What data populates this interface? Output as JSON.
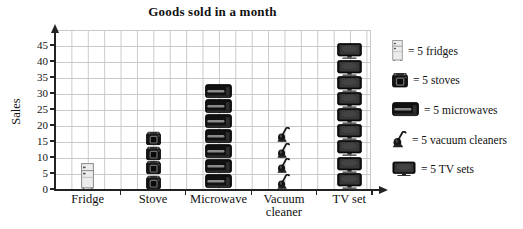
{
  "title": "Goods sold in a month",
  "y_axis": {
    "label": "Sales",
    "ticks": [
      0,
      5,
      10,
      15,
      20,
      25,
      30,
      35,
      40,
      45
    ]
  },
  "legend": [
    {
      "icon": "fridge-icon",
      "label": "= 5 fridges"
    },
    {
      "icon": "stove-icon",
      "label": "= 5 stoves"
    },
    {
      "icon": "microwave-icon",
      "label": "= 5 microwaves"
    },
    {
      "icon": "vacuum-icon",
      "label": "= 5 vacuum cleaners"
    },
    {
      "icon": "tv-icon",
      "label": "= 5 TV sets"
    }
  ],
  "chart_data": {
    "type": "bar",
    "style": "pictograph",
    "title": "Goods sold in a month",
    "xlabel": "",
    "ylabel": "Sales",
    "categories": [
      "Fridge",
      "Stove",
      "Microwave",
      "Vacuum cleaner",
      "TV set"
    ],
    "icon_counts": [
      1,
      4,
      7,
      4,
      9
    ],
    "units_per_icon": 5,
    "values": [
      5,
      20,
      35,
      20,
      45
    ],
    "ylim": [
      0,
      50
    ],
    "ytick_step": 5,
    "grid": true,
    "legend_position": "right"
  }
}
